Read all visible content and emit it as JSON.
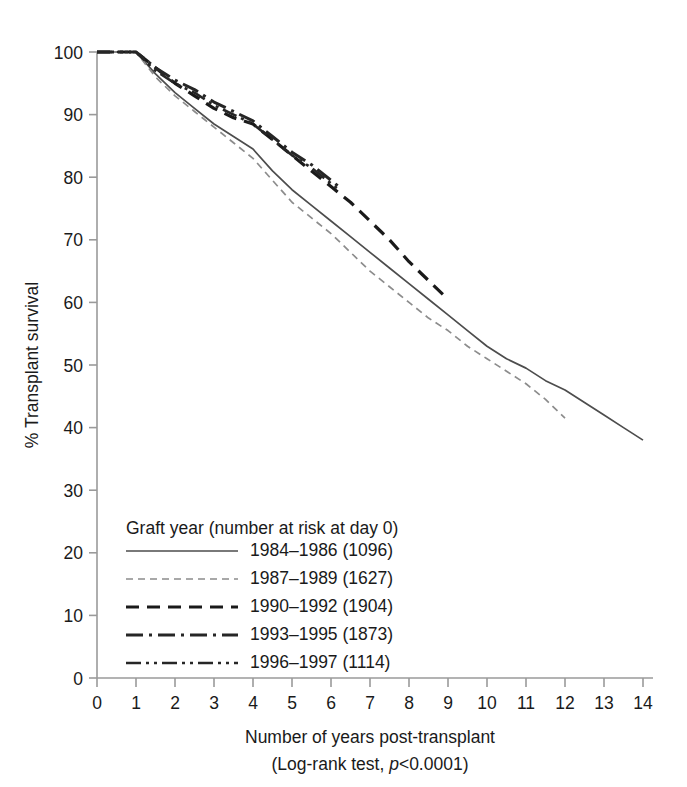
{
  "chart_data": {
    "type": "line",
    "title": "",
    "xlabel": "Number of years post-transplant",
    "xsublabel": "(Log-rank test, p<0.0001)",
    "ylabel": "% Transplant survival",
    "xlim": [
      0,
      14
    ],
    "ylim": [
      0,
      100
    ],
    "xticks": [
      "0",
      "1",
      "2",
      "3",
      "4",
      "5",
      "6",
      "7",
      "8",
      "9",
      "10",
      "11",
      "12",
      "13",
      "14"
    ],
    "yticks": [
      "0",
      "10",
      "20",
      "30",
      "40",
      "50",
      "60",
      "70",
      "80",
      "90",
      "100"
    ],
    "grid": false,
    "legend_position": "inside-lower-left",
    "legend_title": "Graft year (number at risk at day 0)",
    "series": [
      {
        "name": "1984–1986 (1096)",
        "label": "1984–1986 (1096)",
        "style": "solid",
        "color": "#4d4d4d",
        "at_risk_day0": 1096,
        "x": [
          0,
          1,
          1.5,
          2,
          2.5,
          3,
          3.5,
          4,
          4.5,
          5,
          5.5,
          6,
          6.5,
          7,
          7.5,
          8,
          8.5,
          9,
          9.5,
          10,
          10.5,
          11,
          11.5,
          12,
          12.5,
          13,
          13.5,
          14
        ],
        "y": [
          100,
          100,
          96.5,
          93.5,
          91.0,
          88.5,
          86.5,
          84.5,
          81.0,
          78.0,
          75.5,
          73.0,
          70.5,
          68.0,
          65.5,
          63.0,
          60.5,
          58.0,
          55.5,
          53.0,
          51.0,
          49.5,
          47.5,
          46.0,
          44.0,
          42.0,
          40.0,
          38.0
        ]
      },
      {
        "name": "1987–1989 (1627)",
        "label": "1987–1989 (1627)",
        "style": "dashed-fine",
        "color": "#8c8c8c",
        "at_risk_day0": 1627,
        "x": [
          0,
          1,
          1.5,
          2,
          2.5,
          3,
          3.5,
          4,
          4.5,
          5,
          5.5,
          6,
          6.5,
          7,
          7.5,
          8,
          8.5,
          9,
          9.5,
          10,
          10.5,
          11,
          11.5,
          12
        ],
        "y": [
          100,
          100,
          96.0,
          93.0,
          90.5,
          88.0,
          85.5,
          83.0,
          79.5,
          76.0,
          73.5,
          71.0,
          68.0,
          65.0,
          62.5,
          60.0,
          57.5,
          55.5,
          53.0,
          51.0,
          49.0,
          47.0,
          44.5,
          41.5
        ]
      },
      {
        "name": "1990–1992 (1904)",
        "label": "1990–1992 (1904)",
        "style": "dashed-coarse",
        "color": "#1a1a1a",
        "at_risk_day0": 1904,
        "x": [
          0,
          1,
          1.5,
          2,
          2.5,
          3,
          3.5,
          4,
          4.5,
          5,
          5.5,
          6,
          6.5,
          7,
          7.5,
          8,
          8.5,
          9
        ],
        "y": [
          100,
          100,
          97.5,
          95.0,
          93.0,
          91.0,
          89.5,
          88.5,
          86.0,
          83.5,
          81.0,
          78.5,
          76.0,
          73.0,
          70.0,
          66.5,
          63.5,
          60.5
        ]
      },
      {
        "name": "1993–1995 (1873)",
        "label": "1993–1995 (1873)",
        "style": "dash-dot",
        "color": "#262626",
        "at_risk_day0": 1873,
        "x": [
          0,
          1,
          1.5,
          2,
          2.5,
          3,
          3.5,
          4,
          4.5,
          5,
          5.5,
          6,
          6.2
        ],
        "y": [
          100,
          100,
          97.5,
          95.5,
          94.0,
          92.0,
          90.5,
          89.0,
          86.5,
          84.0,
          82.0,
          79.5,
          78.5
        ]
      },
      {
        "name": "1996–1997 (1114)",
        "label": "1996–1997 (1114)",
        "style": "dash-dot-dot",
        "color": "#262626",
        "at_risk_day0": 1114,
        "x": [
          0,
          1,
          1.5,
          2,
          2.5,
          3,
          3.5,
          4,
          4.5,
          5,
          5.5,
          6,
          6.2
        ],
        "y": [
          100,
          100,
          97.0,
          95.0,
          93.5,
          91.5,
          90.0,
          88.5,
          86.0,
          83.5,
          81.5,
          79.0,
          78.0
        ]
      }
    ]
  },
  "axes": {
    "y_axis_title": "% Transplant survival",
    "x_axis_title": "Number of years post-transplant",
    "x_axis_subtitle_prefix": "(Log-rank test, ",
    "x_axis_subtitle_italic": "p",
    "x_axis_subtitle_suffix": "<0.0001)"
  },
  "legend": {
    "title": "Graft year (number at risk at day 0)",
    "entries": [
      {
        "label": "1984–1986 (1096)",
        "style": "solid"
      },
      {
        "label": "1987–1989 (1627)",
        "style": "dashed-fine"
      },
      {
        "label": "1990–1992 (1904)",
        "style": "dashed-coarse"
      },
      {
        "label": "1993–1995 (1873)",
        "style": "dash-dot"
      },
      {
        "label": "1996–1997 (1114)",
        "style": "dash-dot-dot"
      }
    ]
  },
  "colors": {
    "axis": "#9a9a9a",
    "text": "#1a1a1a",
    "series_1": "#4d4d4d",
    "series_2": "#8c8c8c",
    "series_3": "#1a1a1a",
    "series_4": "#262626",
    "series_5": "#262626"
  }
}
